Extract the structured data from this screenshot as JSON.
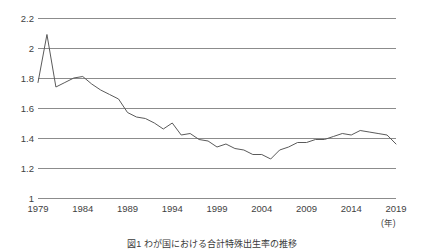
{
  "chart_data": {
    "type": "line",
    "title": "",
    "caption": "図1 わが国における合計特殊出生率の推移",
    "xlabel": "年",
    "ylabel": "",
    "xlim": [
      1979,
      2019
    ],
    "ylim": [
      1.0,
      2.2
    ],
    "grid": true,
    "legend": "none",
    "line_color": "#5a5a5a",
    "grid_color": "#8c8c8c",
    "x_tick_labels": [
      "1979",
      "1984",
      "1989",
      "1994",
      "1999",
      "2004",
      "2009",
      "2014",
      "2019"
    ],
    "y_tick_labels": [
      "1",
      "1.2",
      "1.4",
      "1.6",
      "1.8",
      "2",
      "2.2"
    ],
    "x_ticks": [
      1979,
      1984,
      1989,
      1994,
      1999,
      2004,
      2009,
      2014,
      2019
    ],
    "y_ticks": [
      1,
      1.2,
      1.4,
      1.6,
      1.8,
      2,
      2.2
    ],
    "unit_note": "(年)",
    "x": [
      1979,
      1980,
      1981,
      1982,
      1983,
      1984,
      1985,
      1986,
      1987,
      1988,
      1989,
      1990,
      1991,
      1992,
      1993,
      1994,
      1995,
      1996,
      1997,
      1998,
      1999,
      2000,
      2001,
      2002,
      2003,
      2004,
      2005,
      2006,
      2007,
      2008,
      2009,
      2010,
      2011,
      2012,
      2013,
      2014,
      2015,
      2016,
      2017,
      2018,
      2019
    ],
    "values": [
      1.77,
      2.09,
      1.74,
      1.77,
      1.8,
      1.81,
      1.76,
      1.72,
      1.69,
      1.66,
      1.57,
      1.54,
      1.53,
      1.5,
      1.46,
      1.5,
      1.42,
      1.43,
      1.39,
      1.38,
      1.34,
      1.36,
      1.33,
      1.32,
      1.29,
      1.29,
      1.26,
      1.32,
      1.34,
      1.37,
      1.37,
      1.39,
      1.39,
      1.41,
      1.43,
      1.42,
      1.45,
      1.44,
      1.43,
      1.42,
      1.36
    ],
    "series": [
      {
        "name": "合計特殊出生率",
        "values": [
          1.77,
          2.09,
          1.74,
          1.77,
          1.8,
          1.81,
          1.76,
          1.72,
          1.69,
          1.66,
          1.57,
          1.54,
          1.53,
          1.5,
          1.46,
          1.5,
          1.42,
          1.43,
          1.39,
          1.38,
          1.34,
          1.36,
          1.33,
          1.32,
          1.29,
          1.29,
          1.26,
          1.32,
          1.34,
          1.37,
          1.37,
          1.39,
          1.39,
          1.41,
          1.43,
          1.42,
          1.45,
          1.44,
          1.43,
          1.42,
          1.36
        ]
      }
    ]
  }
}
